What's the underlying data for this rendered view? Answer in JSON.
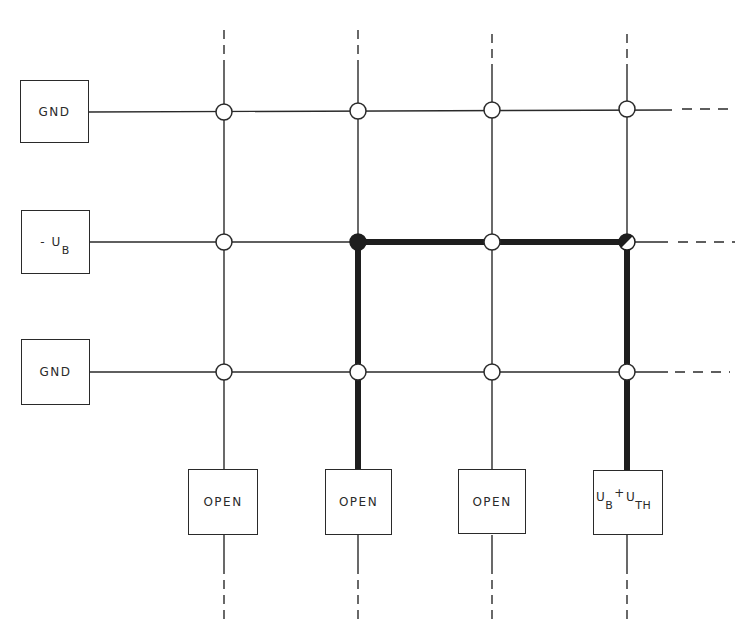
{
  "diagram": {
    "type": "crosspoint-matrix",
    "rows": [
      {
        "label": "GND",
        "y": 112
      },
      {
        "label": "-U",
        "sub": "B",
        "y": 242
      },
      {
        "label": "GND",
        "y": 372
      }
    ],
    "columns": [
      {
        "label": "OPEN",
        "x": 224
      },
      {
        "label": "OPEN",
        "x": 358
      },
      {
        "label": "OPEN",
        "x": 492
      },
      {
        "label": "U",
        "sub1": "B",
        "plus": "+",
        "label2": "U",
        "sub2": "TH",
        "x": 627
      }
    ],
    "nodes": {
      "filled": [
        [
          1,
          1
        ]
      ],
      "half_filled": [
        [
          1,
          3
        ]
      ]
    },
    "highlighted_path": "row -U_B from column 2 to column 4, column 2 and column 4 down to bottom boxes",
    "colors": {
      "line": "#2a2a2a",
      "background": "#ffffff"
    }
  },
  "labels": {
    "row0": "GND",
    "row1_main": "- U",
    "row1_sub": "B",
    "row2": "GND",
    "col0": "OPEN",
    "col1": "OPEN",
    "col2": "OPEN",
    "col3_main1": "U",
    "col3_sub1": "B",
    "col3_plus": "+",
    "col3_main2": "U",
    "col3_sub2": "TH"
  }
}
